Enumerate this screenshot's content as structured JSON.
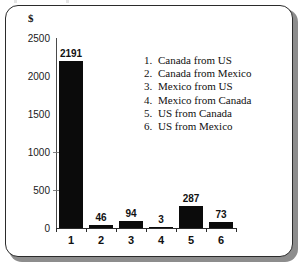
{
  "chart_data": {
    "type": "bar",
    "title": "",
    "subtitle": "",
    "xlabel": "",
    "ylabel": "$",
    "unit_label": "$",
    "categories": [
      "1",
      "2",
      "3",
      "4",
      "5",
      "6"
    ],
    "values": [
      2191,
      46,
      94,
      3,
      287,
      73
    ],
    "data_labels": [
      "2191",
      "46",
      "94",
      "3",
      "287",
      "73"
    ],
    "ylim": [
      0,
      2500
    ],
    "ytick_labels": [
      "0",
      "500",
      "1000",
      "1500",
      "2000",
      "2500"
    ],
    "ytick_values": [
      0,
      500,
      1000,
      1500,
      2000,
      2500
    ],
    "grid": false,
    "legend_position": "inside-upper-right",
    "series": [
      {
        "name": "Value",
        "color": "#0b0b0b",
        "values": [
          2191,
          46,
          94,
          3,
          287,
          73
        ]
      }
    ],
    "legend": [
      {
        "key": "1.",
        "label": "Canada from US"
      },
      {
        "key": "2.",
        "label": "Canada from Mexico"
      },
      {
        "key": "3.",
        "label": "Mexico from US"
      },
      {
        "key": "4.",
        "label": "Mexico from Canada"
      },
      {
        "key": "5.",
        "label": "US from Canada"
      },
      {
        "key": "6.",
        "label": "US from Mexico"
      }
    ],
    "colors": {
      "bar": "#0b0b0b",
      "axis": "#2b2b2b",
      "text": "#111111",
      "frame": "#2b2b2b",
      "shadow": "#8d8d8d",
      "background": "#ffffff"
    }
  }
}
